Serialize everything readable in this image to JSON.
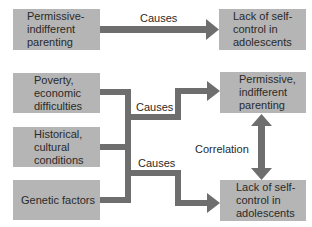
{
  "top_row": {
    "left_box": "Permissive-\nindifferent\nparenting",
    "arrow_label": "Causes",
    "right_box": "Lack of self-\ncontrol in\nadolescents"
  },
  "bottom_section": {
    "left_boxes": [
      "Poverty,\neconomic\ndifficulties",
      "Historical,\ncultural\nconditions",
      "Genetic factors"
    ],
    "arrow_labels": [
      "Causes",
      "Causes"
    ],
    "right_boxes": [
      "Permissive,\nindifferent\nparenting",
      "Lack of self-\ncontrol in\nadolescents"
    ],
    "correlation_label": "Correlation"
  },
  "colors": {
    "box_fill": "#b5b5b5",
    "arrow": "#6e6e6e",
    "text": "#2a2a2a"
  }
}
